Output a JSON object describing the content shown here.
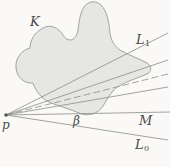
{
  "figure": {
    "type": "geometry-diagram",
    "width": 170,
    "height": 167,
    "background_color": "#faf9f7",
    "blob": {
      "name": "K",
      "fill_color": "#e6e6e4",
      "stroke_color": "#9a9a98",
      "stroke_width": 0.9,
      "description": "irregular closed convex-ish region with two rounded peaks at top"
    },
    "apex": {
      "name": "p",
      "x": 6,
      "y": 115
    },
    "labels": {
      "K": "K",
      "L1_base": "L",
      "L1_sub": "1",
      "L0_base": "L",
      "L0_sub": "0",
      "M": "M",
      "beta": "β",
      "p": "p"
    },
    "rays": [
      {
        "name": "L1",
        "label": "L₁",
        "x1": 6,
        "y1": 115,
        "x2": 168,
        "y2": 33,
        "dashed": false,
        "color": "#8c8c8a",
        "width": 0.8
      },
      {
        "name": "ray-upper-tangent",
        "label": "",
        "x1": 6,
        "y1": 115,
        "x2": 168,
        "y2": 60,
        "dashed": false,
        "color": "#8c8c8a",
        "width": 0.8
      },
      {
        "name": "ray-dashed-middle",
        "label": "",
        "x1": 6,
        "y1": 115,
        "x2": 168,
        "y2": 74,
        "dashed": true,
        "color": "#8c8c8a",
        "width": 0.8
      },
      {
        "name": "ray-lower-tangent",
        "label": "",
        "x1": 6,
        "y1": 115,
        "x2": 168,
        "y2": 87,
        "dashed": false,
        "color": "#8c8c8a",
        "width": 0.8
      },
      {
        "name": "M",
        "label": "M",
        "x1": 6,
        "y1": 115,
        "x2": 170,
        "y2": 112,
        "dashed": false,
        "color": "#8c8c8a",
        "width": 0.8
      },
      {
        "name": "L0",
        "label": "L₀",
        "x1": 6,
        "y1": 115,
        "x2": 168,
        "y2": 140,
        "dashed": false,
        "color": "#8c8c8a",
        "width": 0.8
      }
    ],
    "angle": {
      "name": "beta",
      "label": "β",
      "vertex_x": 6,
      "vertex_y": 115,
      "between": [
        "M",
        "L0"
      ]
    }
  }
}
